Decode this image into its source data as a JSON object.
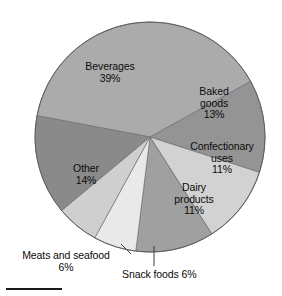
{
  "chart_data": {
    "type": "pie",
    "title": "",
    "categories": [
      "Beverages",
      "Baked goods",
      "Confectionary uses",
      "Dairy products",
      "Snack foods",
      "Meats and seafood",
      "Other"
    ],
    "values": [
      39,
      13,
      11,
      11,
      6,
      6,
      14
    ],
    "unit": "%",
    "legend": "none",
    "labels_inside": [
      "Beverages",
      "Baked goods",
      "Confectionary uses",
      "Dairy products",
      "Other"
    ],
    "labels_callout": [
      "Meats and seafood",
      "Snack foods"
    ],
    "colors": [
      "#ababab",
      "#949494",
      "#d2d2d2",
      "#a0a0a0",
      "#e9e9e9",
      "#cfcfcf",
      "#8a8a8a"
    ],
    "slices": [
      {
        "name": "Beverages",
        "value": 39,
        "label": "Beverages\n39%",
        "color": "#ababab"
      },
      {
        "name": "Baked goods",
        "value": 13,
        "label": "Baked\ngoods\n13%",
        "color": "#949494"
      },
      {
        "name": "Confectionary uses",
        "value": 11,
        "label": "Confectionary\nuses\n11%",
        "color": "#d2d2d2"
      },
      {
        "name": "Dairy products",
        "value": 11,
        "label": "Dairy\nproducts\n11%",
        "color": "#a0a0a0"
      },
      {
        "name": "Snack foods",
        "value": 6,
        "label": "Snack foods 6%",
        "color": "#e9e9e9"
      },
      {
        "name": "Meats and seafood",
        "value": 6,
        "label": "Meats and seafood\n6%",
        "color": "#cfcfcf"
      },
      {
        "name": "Other",
        "value": 14,
        "label": "Other\n14%",
        "color": "#8a8a8a"
      }
    ]
  },
  "labels": {
    "beverages": "Beverages\n39%",
    "baked_goods": "Baked\ngoods\n13%",
    "confectionary": "Confectionary\nuses\n11%",
    "dairy": "Dairy\nproducts\n11%",
    "other": "Other\n14%",
    "meats": "Meats and seafood\n6%",
    "snack": "Snack foods 6%"
  }
}
